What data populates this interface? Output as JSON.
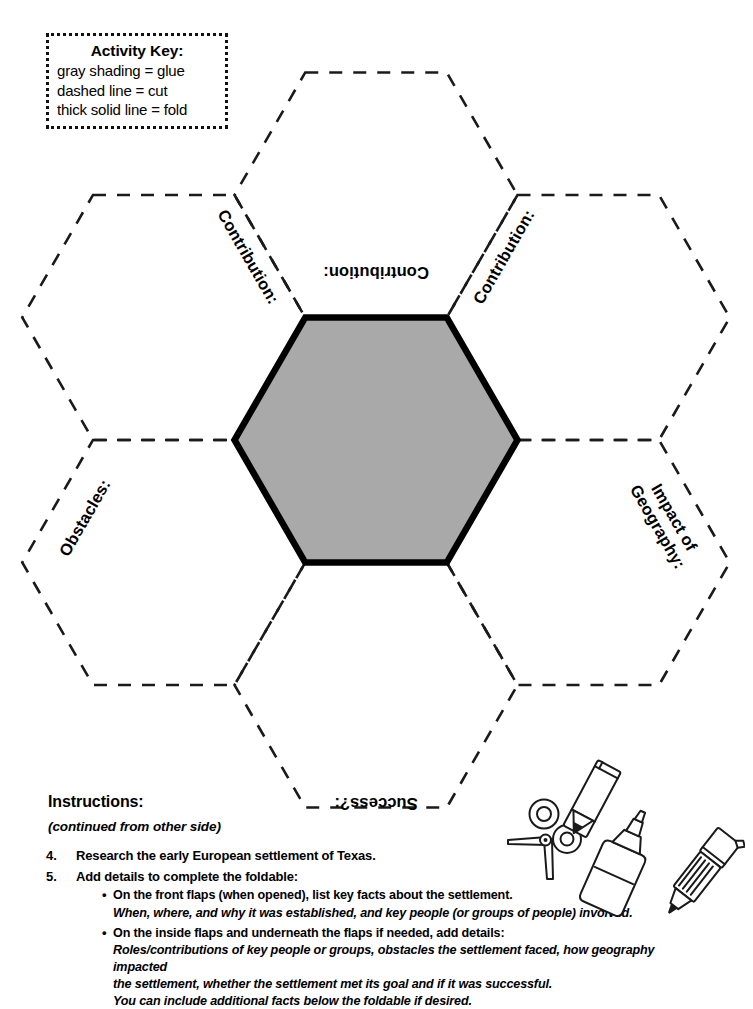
{
  "page": {
    "background_color": "#ffffff",
    "ink_color": "#000000",
    "glue_shading_color": "#a9a9a9"
  },
  "activity_key": {
    "title": "Activity Key:",
    "lines": [
      "gray shading = glue",
      "dashed line = cut",
      "thick solid line = fold"
    ]
  },
  "foldable": {
    "center_flap": {
      "name": "glue-center",
      "fill": "#a9a9a9",
      "border_style": "thick solid line = fold",
      "label": ""
    },
    "flaps": [
      {
        "position": "top",
        "label": "Contribution:",
        "rotation_deg": 180,
        "line_style": "dashed"
      },
      {
        "position": "upper-left",
        "label": "Contribution:",
        "rotation_deg": 60,
        "line_style": "dashed"
      },
      {
        "position": "upper-right",
        "label": "Contribution:",
        "rotation_deg": -60,
        "line_style": "dashed"
      },
      {
        "position": "lower-left",
        "label": "Obstacles:",
        "rotation_deg": -60,
        "line_style": "dashed"
      },
      {
        "position": "lower-right",
        "label": "Impact of Geography:",
        "label_line1": "Impact of",
        "label_line2": "Geography:",
        "rotation_deg": 60,
        "line_style": "dashed"
      },
      {
        "position": "bottom",
        "label": "Success?:",
        "rotation_deg": 180,
        "line_style": "dashed"
      }
    ]
  },
  "instructions": {
    "heading": "Instructions:",
    "subheading": "(continued from other side)",
    "steps": [
      {
        "number": "4.",
        "text": "Research the early European settlement of Texas.",
        "sub_items": []
      },
      {
        "number": "5.",
        "text": "Add details to complete the foldable:",
        "sub_items": [
          {
            "bullet": "•",
            "main": "On the front flaps (when opened), list key facts about the settlement.",
            "italic_lines": [
              "When, where, and why it was established, and key people (or groups of people) involved."
            ]
          },
          {
            "bullet": "•",
            "main": "On the inside flaps and underneath the flaps if needed, add details:",
            "italic_lines": [
              "Roles/contributions of key people or groups, obstacles the settlement faced, how geography impacted",
              "the settlement, whether the settlement met its goal and if it was successful.",
              "You can include additional facts below the foldable if desired."
            ]
          }
        ]
      }
    ]
  },
  "supply_icons": [
    {
      "name": "scissors-icon"
    },
    {
      "name": "crayon-icon"
    },
    {
      "name": "glue-bottle-icon"
    },
    {
      "name": "marker-icon"
    }
  ]
}
